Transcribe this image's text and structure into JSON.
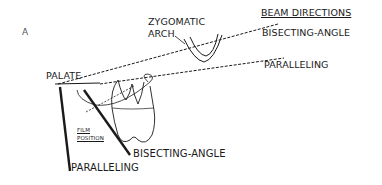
{
  "figure": {
    "panel_label": "A",
    "labels": {
      "zygomatic_arch_line1": "ZYGOMATIC",
      "zygomatic_arch_line2": "ARCH",
      "palate": "PALATE",
      "film_position_line1": "FILM",
      "film_position_line2": "POSITION"
    },
    "beam_directions": {
      "title": "BEAM DIRECTIONS",
      "bisecting_angle": "BISECTING-ANGLE",
      "paralleling": "PARALLELING"
    },
    "film_positions": {
      "bisecting_angle": "BISECTING-ANGLE",
      "paralleling": "PARALLELING"
    },
    "colors": {
      "line": "#1a1a1a",
      "background": "#ffffff"
    }
  }
}
